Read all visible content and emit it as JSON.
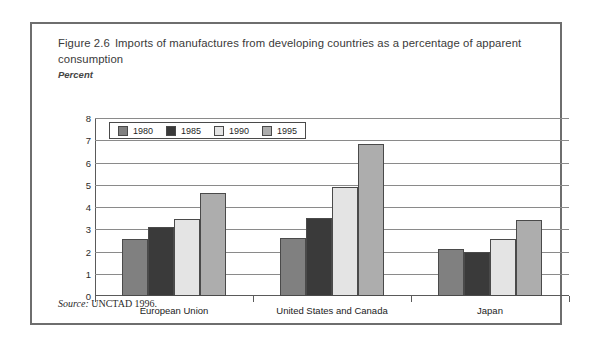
{
  "figure": {
    "number": "Figure 2.6",
    "title": "Imports of manufactures from developing countries as a percentage of apparent consumption",
    "axis_note": "Percent",
    "source_keyword": "Source:",
    "source_text": "UNCTAD 1996."
  },
  "colors": {
    "series_1980": "#808080",
    "series_1985": "#3a3a3a",
    "series_1990": "#e4e4e4",
    "series_1995": "#adadad",
    "bar_outline": "#4a4a4a",
    "gridline": "#8a8a8a",
    "frame": "#6e6e6e",
    "title_text": "#3a3a3a"
  },
  "chart_data": {
    "type": "bar",
    "xlabel": "",
    "ylabel": "Percent",
    "ylim": [
      0,
      8
    ],
    "yticks": [
      0,
      1,
      2,
      3,
      4,
      5,
      6,
      7,
      8
    ],
    "ytick_labels": [
      "0",
      "1",
      "2",
      "3",
      "4",
      "5",
      "6",
      "7",
      "8"
    ],
    "grid": true,
    "legend_position": "upper-left-inside",
    "categories": [
      "European Union",
      "United States and Canada",
      "Japan"
    ],
    "series": [
      {
        "name": "1980",
        "color": "#808080",
        "values": [
          2.55,
          2.6,
          2.1
        ]
      },
      {
        "name": "1985",
        "color": "#3a3a3a",
        "values": [
          3.1,
          3.5,
          2.0
        ]
      },
      {
        "name": "1990",
        "color": "#e4e4e4",
        "values": [
          3.45,
          4.9,
          2.55
        ]
      },
      {
        "name": "1995",
        "color": "#adadad",
        "values": [
          4.65,
          6.85,
          3.4
        ]
      }
    ]
  }
}
